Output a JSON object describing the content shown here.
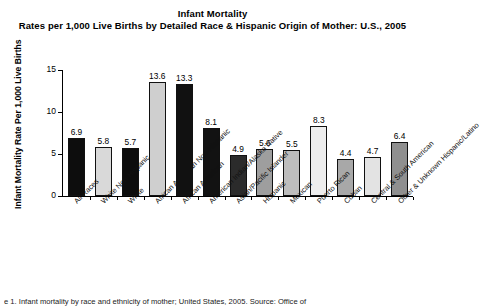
{
  "figure": {
    "title_line1": "Infant Mortality",
    "title_line2": "Rates per 1,000 Live Births by Detailed Race & Hispanic Origin of Mother: U.S., 2005",
    "caption": "e 1. Infant mortality by race and ethnicity of mother; United States, 2005. Source: Office of"
  },
  "chart_data": {
    "type": "bar",
    "title": "Infant Mortality Rates per 1,000 Live Births by Detailed Race & Hispanic Origin of Mother: U.S., 2005",
    "xlabel": "",
    "ylabel": "Infant Mortality Rate Per 1,000 Live Births",
    "ylim": [
      0,
      15
    ],
    "yticks": [
      0,
      5,
      10,
      15
    ],
    "ytick_labels": [
      "0",
      "5",
      "10",
      "15"
    ],
    "grid": false,
    "legend": "none",
    "categories": [
      "All Races",
      "White Non-Hispanic",
      "White",
      "African American Non-Hispanic",
      "African American",
      "American Indian/Alaska Native",
      "Asian/Pacific Islander",
      "Hispanic",
      "Mexican",
      "Puerto Rican",
      "Cuban",
      "Central & South American",
      "Other & Unknown Hispanic/Latino"
    ],
    "values": [
      6.9,
      5.8,
      5.7,
      13.6,
      13.3,
      8.1,
      4.9,
      5.6,
      5.5,
      8.3,
      4.4,
      4.7,
      6.4
    ],
    "value_labels": [
      "6.9",
      "5.8",
      "5.7",
      "13.6",
      "13.3",
      "8.1",
      "4.9",
      "5.6",
      "5.5",
      "8.3",
      "4.4",
      "4.7",
      "6.4"
    ],
    "bar_colors": [
      "#0d0d0d",
      "#d9d9d9",
      "#0d0d0d",
      "#cfcfcf",
      "#111111",
      "#121212",
      "#2b2b2b",
      "#9e9e9e",
      "#bdbdbd",
      "#ededed",
      "#a8a8a8",
      "#e3e3e3",
      "#8f8f8f"
    ]
  }
}
